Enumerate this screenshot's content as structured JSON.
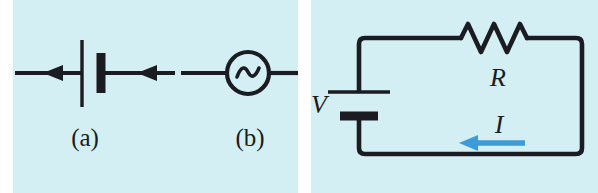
{
  "figure": {
    "width": 598,
    "height": 193,
    "background": "#ffffff",
    "panel_background": "#d4eff4",
    "ink_color": "#1b1b22",
    "current_color": "#3d9bd8"
  },
  "panel_a": {
    "name": "circuit-symbols-panel",
    "caption_a": "(a)",
    "caption_b": "(b)",
    "symbol_a": {
      "name": "dc-battery-symbol",
      "description": "battery source",
      "arrow_count": 2,
      "arrow_direction": "left"
    },
    "symbol_b": {
      "name": "ac-source-symbol",
      "description": "alternating current source",
      "glyph": "sine-wave"
    }
  },
  "panel_b": {
    "name": "series-circuit-panel",
    "voltage_label": "V",
    "resistor_label": "R",
    "current_label": "I",
    "resistor": {
      "name": "resistor-symbol",
      "peaks": 5
    },
    "battery": {
      "name": "battery-symbol",
      "plates": [
        "long-thin",
        "short-thick"
      ]
    },
    "current_arrow": {
      "name": "current-direction-arrow",
      "direction": "left",
      "color": "#3d9bd8"
    }
  }
}
